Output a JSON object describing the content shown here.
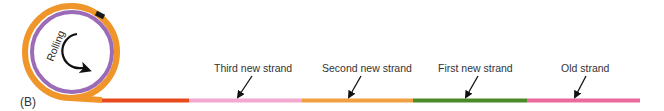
{
  "panel_label": "(B)",
  "circle": {
    "label": "Rolling",
    "outer_color": "#f0952a",
    "inner_color": "#9b6bb8",
    "marker_color": "#1a1a1a"
  },
  "strands": [
    {
      "name": "tail-strand",
      "label": "",
      "color": "#e84a1e",
      "x1": 102,
      "x2": 189
    },
    {
      "name": "third-new-strand",
      "label": "Third new strand",
      "color": "#f2a8cf",
      "x1": 189,
      "x2": 302
    },
    {
      "name": "second-new-strand",
      "label": "Second new strand",
      "color": "#f0a040",
      "x1": 302,
      "x2": 413
    },
    {
      "name": "first-new-strand",
      "label": "First new strand",
      "color": "#4a8a2a",
      "x1": 413,
      "x2": 527
    },
    {
      "name": "old-strand",
      "label": "Old strand",
      "color": "#ea6a9e",
      "x1": 527,
      "x2": 640
    }
  ],
  "labels": {
    "third": "Third new strand",
    "second": "Second new strand",
    "first": "First new strand",
    "old": "Old strand"
  }
}
